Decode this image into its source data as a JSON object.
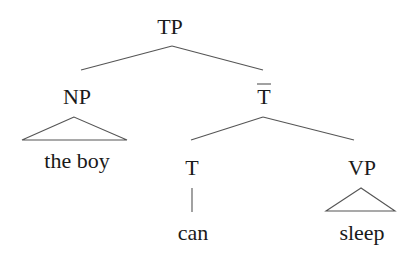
{
  "tree": {
    "root": {
      "label": "TP"
    },
    "subject": {
      "label": "NP",
      "leaf": "the boy",
      "leaf_style": "triangle"
    },
    "tbar": {
      "label": "T",
      "bar": true
    },
    "head": {
      "label": "T",
      "leaf": "can"
    },
    "complement": {
      "label": "VP",
      "leaf": "sleep",
      "leaf_style": "triangle"
    }
  },
  "colors": {
    "text": "#1a1a1a",
    "lines": "#555555",
    "background": "#ffffff"
  }
}
